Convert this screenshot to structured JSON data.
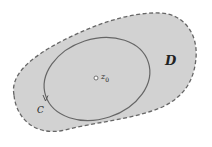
{
  "diagram": {
    "region": {
      "label": "D",
      "fill": "#d2d2d2",
      "stroke": "#666666",
      "style": "dashed"
    },
    "contour": {
      "label": "C",
      "stroke": "#666666",
      "orientation": "counterclockwise"
    },
    "point": {
      "label": "z",
      "subscript": "0"
    }
  }
}
